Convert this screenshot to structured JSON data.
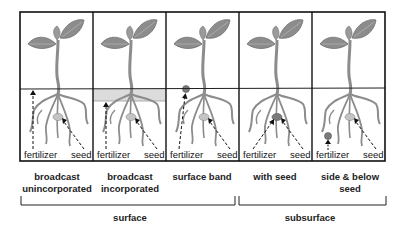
{
  "diagram": {
    "colors": {
      "frame": "#111111",
      "plant": "#8c8c8c",
      "plant_dark": "#6f6f6f",
      "incorporated_band": "#dcdcdc",
      "fertilizer_dot": "#7a7a7a",
      "seed": "#c4c4c4"
    },
    "panels": [
      {
        "id": "broadcast-unincorporated",
        "fert_label": "fertilizer",
        "seed_label": "seed",
        "fert_placement": "surface-broadcast",
        "label_lines": [
          "broadcast",
          "unincorporated"
        ]
      },
      {
        "id": "broadcast-incorporated",
        "fert_label": "fertilizer",
        "seed_label": "seed",
        "fert_placement": "incorporated-band",
        "label_lines": [
          "broadcast",
          "incorporated"
        ]
      },
      {
        "id": "surface-band",
        "fert_label": "fertilizer",
        "seed_label": "seed",
        "fert_placement": "surface-dot",
        "label_lines": [
          "surface band"
        ]
      },
      {
        "id": "with-seed",
        "fert_label": "fertilizer",
        "seed_label": "seed",
        "fert_placement": "with-seed",
        "label_lines": [
          "with seed"
        ]
      },
      {
        "id": "side-below-seed",
        "fert_label": "fertilizer",
        "seed_label": "seed",
        "fert_placement": "side-below",
        "label_lines": [
          "side & below",
          "seed"
        ]
      }
    ],
    "groups": [
      {
        "label": "surface",
        "spans_panels": [
          0,
          1,
          2
        ]
      },
      {
        "label": "subsurface",
        "spans_panels": [
          3,
          4
        ]
      }
    ]
  }
}
